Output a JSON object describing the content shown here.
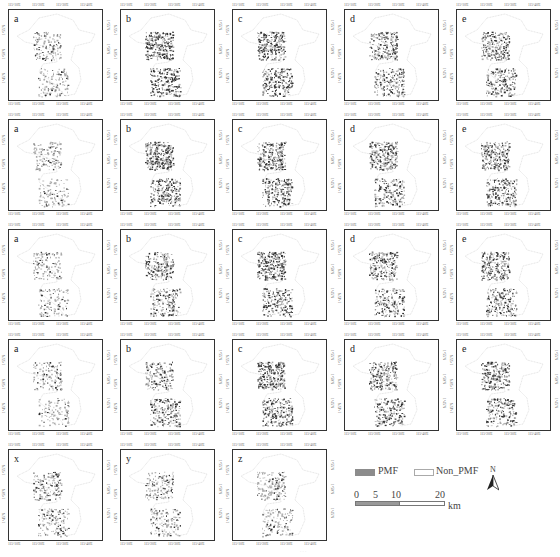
{
  "figure": {
    "x_ticks": [
      "115°10'E",
      "115°20'E",
      "115°30'E",
      "115°40'E"
    ],
    "y_ticks": [
      "1°55'N",
      "1°50'N",
      "1°45'N"
    ],
    "rows": [
      {
        "panels": [
          {
            "label": "a",
            "density": 0.35
          },
          {
            "label": "b",
            "density": 0.9
          },
          {
            "label": "c",
            "density": 0.85
          },
          {
            "label": "d",
            "density": 0.7
          },
          {
            "label": "e",
            "density": 0.75
          }
        ]
      },
      {
        "panels": [
          {
            "label": "a",
            "density": 0.3
          },
          {
            "label": "b",
            "density": 0.9
          },
          {
            "label": "c",
            "density": 0.8
          },
          {
            "label": "d",
            "density": 0.75
          },
          {
            "label": "e",
            "density": 0.8
          }
        ]
      },
      {
        "panels": [
          {
            "label": "a",
            "density": 0.3
          },
          {
            "label": "b",
            "density": 0.6
          },
          {
            "label": "c",
            "density": 0.85
          },
          {
            "label": "d",
            "density": 0.7
          },
          {
            "label": "e",
            "density": 0.75
          }
        ]
      },
      {
        "panels": [
          {
            "label": "a",
            "density": 0.3
          },
          {
            "label": "b",
            "density": 0.6
          },
          {
            "label": "c",
            "density": 0.9
          },
          {
            "label": "d",
            "density": 0.7
          },
          {
            "label": "e",
            "density": 0.75
          }
        ]
      },
      {
        "panels": [
          {
            "label": "x",
            "density": 0.45
          },
          {
            "label": "y",
            "density": 0.4
          },
          {
            "label": "z",
            "density": 0.4
          }
        ]
      }
    ]
  },
  "legend": {
    "items": [
      {
        "label": "PMF",
        "color": "#8c8c8c"
      },
      {
        "label": "Non_PMF",
        "color": "#ffffff"
      }
    ],
    "scale": {
      "ticks": [
        "0",
        "5",
        "10",
        "20"
      ],
      "unit": "km"
    },
    "north": "N"
  }
}
